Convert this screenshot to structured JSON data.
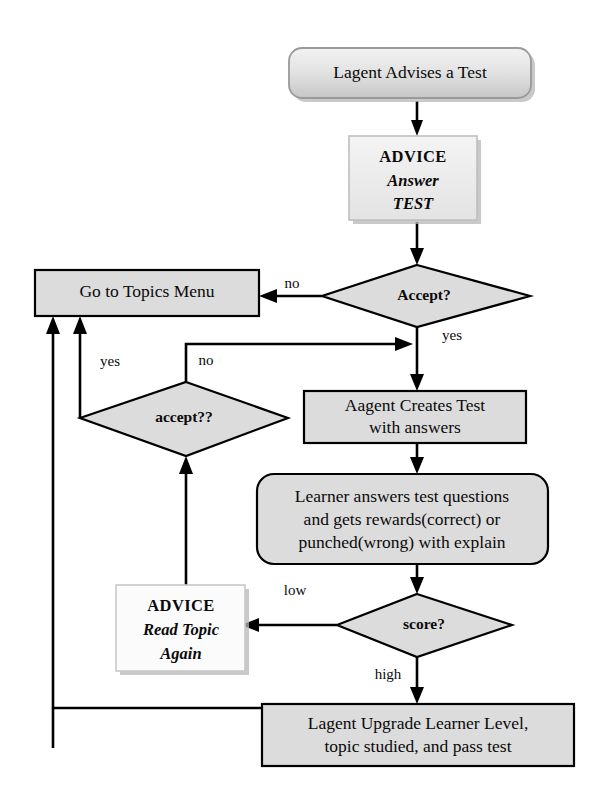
{
  "diagram": {
    "background": "#ffffff",
    "fill_gray": "#dcdcdc",
    "fill_light": "#eeeeee",
    "stroke": "#000000"
  },
  "nodes": {
    "start": {
      "shape": "rounded-rect",
      "label": "Lagent Advises a Test"
    },
    "advice_answer_test": {
      "shape": "rect",
      "line1": "ADVICE",
      "line2": "Answer",
      "line3": "TEST"
    },
    "accept_decision": {
      "shape": "diamond",
      "label": "Accept?"
    },
    "go_to_topics_menu": {
      "shape": "rect",
      "label": "Go to Topics Menu"
    },
    "accept2_decision": {
      "shape": "diamond",
      "label": "accept??"
    },
    "aagent_creates_test": {
      "shape": "rect",
      "line1": "Aagent Creates Test",
      "line2": "with  answers"
    },
    "learner_answers": {
      "shape": "rounded-rect",
      "line1": "Learner answers test questions",
      "line2": "and gets rewards(correct) or",
      "line3": "punched(wrong) with explain"
    },
    "score_decision": {
      "shape": "diamond",
      "label": "score?"
    },
    "advice_read_topic": {
      "shape": "rect",
      "line1": "ADVICE",
      "line2": "Read Topic",
      "line3": "Again"
    },
    "lagent_upgrade": {
      "shape": "rect",
      "line1": "Lagent Upgrade Learner Level,",
      "line2": "topic studied, and pass test"
    }
  },
  "edge_labels": {
    "accept_no": "no",
    "accept_yes": "yes",
    "accept2_yes": "yes",
    "accept2_no": "no",
    "score_low": "low",
    "score_high": "high"
  }
}
